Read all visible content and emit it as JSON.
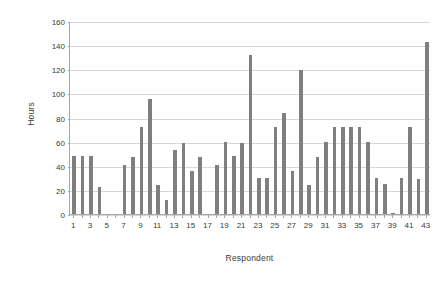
{
  "chart_data": {
    "type": "bar",
    "title": "",
    "xlabel": "Respondent",
    "ylabel": "Hours",
    "ylim": [
      0,
      160
    ],
    "ytick_step": 20,
    "yticks": [
      0,
      20,
      40,
      60,
      80,
      100,
      120,
      140,
      160
    ],
    "grid": true,
    "legend": null,
    "bar_color": "#7f7f7f",
    "gridline_color": "#d9d9d9",
    "axis_color": "#a6a6a6",
    "text_color": "#3a3a3a",
    "categories": [
      1,
      2,
      3,
      4,
      5,
      6,
      7,
      8,
      9,
      10,
      11,
      12,
      13,
      14,
      15,
      16,
      17,
      18,
      19,
      20,
      21,
      22,
      23,
      24,
      25,
      26,
      27,
      28,
      29,
      30,
      31,
      32,
      33,
      34,
      35,
      36,
      37,
      38,
      39,
      40,
      41,
      42,
      43
    ],
    "xtick_labels": [
      1,
      3,
      5,
      7,
      9,
      11,
      13,
      15,
      17,
      19,
      21,
      23,
      25,
      27,
      29,
      31,
      33,
      35,
      37,
      39,
      41,
      43
    ],
    "values": [
      48,
      48,
      48,
      22,
      0,
      0,
      41,
      47,
      72,
      95,
      24,
      12,
      53,
      59,
      36,
      47,
      0,
      41,
      60,
      48,
      59,
      132,
      30,
      30,
      72,
      84,
      36,
      119,
      24,
      47,
      60,
      72,
      72,
      72,
      72,
      60,
      30,
      25,
      1,
      30,
      72,
      29,
      143
    ]
  }
}
